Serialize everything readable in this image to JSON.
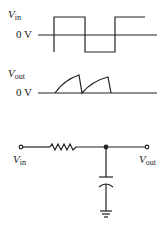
{
  "diagram": {
    "colors": {
      "line": "#222222",
      "background": "#ffffff"
    },
    "input_waveform": {
      "label_main": "V",
      "label_sub": "in",
      "axis_label": "0 V",
      "shape": "square wave"
    },
    "output_waveform": {
      "label_main": "V",
      "label_sub": "out",
      "axis_label": "0 V",
      "shape": "exponential charge / sawtooth"
    },
    "circuit": {
      "input_label_main": "V",
      "input_label_sub": "in",
      "output_label_main": "V",
      "output_label_sub": "out",
      "components": [
        "resistor",
        "capacitor",
        "ground"
      ]
    }
  }
}
